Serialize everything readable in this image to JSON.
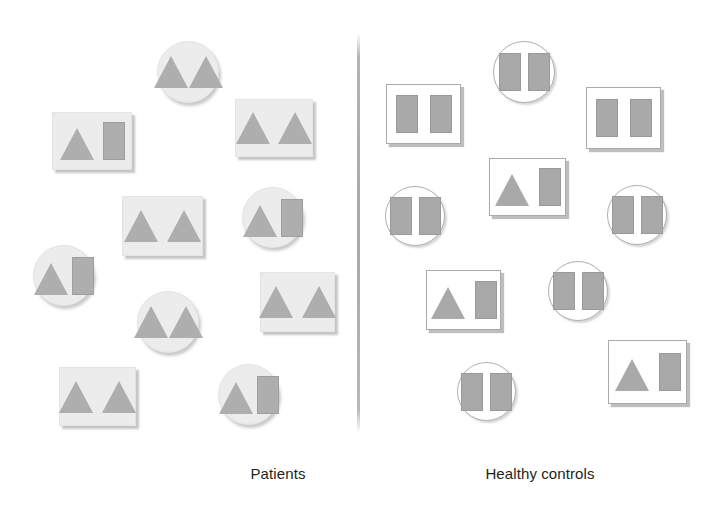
{
  "figure": {
    "width": 717,
    "height": 515,
    "background": "#ffffff",
    "divider": {
      "x": 357,
      "y": 33,
      "length": 400,
      "color": "#a8a8a8"
    },
    "glyph_color": "#a9a9a9",
    "caption_color": "#231f20",
    "filled_card_fill": "#ececed",
    "outline_card_stroke": "#a9a9a9"
  },
  "groups": [
    {
      "id": "patients",
      "caption": "Patients",
      "caption_x": 278,
      "caption_y": 465,
      "card_style": "filled",
      "items": [
        {
          "shape": "circle",
          "x": 157,
          "y": 41,
          "w": 62,
          "h": 62,
          "glyphs": [
            "triangle",
            "triangle"
          ],
          "gap": 1
        },
        {
          "shape": "square",
          "x": 52,
          "y": 112,
          "w": 80,
          "h": 58,
          "glyphs": [
            "triangle",
            "rect"
          ],
          "gap": 9
        },
        {
          "shape": "square",
          "x": 235,
          "y": 99,
          "w": 78,
          "h": 58,
          "glyphs": [
            "triangle",
            "triangle"
          ],
          "gap": 8
        },
        {
          "shape": "square",
          "x": 122,
          "y": 196,
          "w": 81,
          "h": 60,
          "glyphs": [
            "triangle",
            "triangle"
          ],
          "gap": 9
        },
        {
          "shape": "circle",
          "x": 242,
          "y": 187,
          "w": 61,
          "h": 61,
          "glyphs": [
            "triangle",
            "rect"
          ],
          "gap": 4
        },
        {
          "shape": "circle",
          "x": 33,
          "y": 245,
          "w": 61,
          "h": 61,
          "glyphs": [
            "triangle",
            "rect"
          ],
          "gap": 4
        },
        {
          "shape": "square",
          "x": 260,
          "y": 272,
          "w": 75,
          "h": 60,
          "glyphs": [
            "triangle",
            "triangle"
          ],
          "gap": 9
        },
        {
          "shape": "circle",
          "x": 137,
          "y": 291,
          "w": 62,
          "h": 62,
          "glyphs": [
            "triangle",
            "triangle"
          ],
          "gap": 1
        },
        {
          "shape": "square",
          "x": 59,
          "y": 367,
          "w": 77,
          "h": 59,
          "glyphs": [
            "triangle",
            "triangle"
          ],
          "gap": 9
        },
        {
          "shape": "circle",
          "x": 218,
          "y": 364,
          "w": 61,
          "h": 61,
          "glyphs": [
            "triangle",
            "rect"
          ],
          "gap": 4
        }
      ]
    },
    {
      "id": "healthy-controls",
      "caption": "Healthy controls",
      "caption_x": 540,
      "caption_y": 465,
      "card_style": "outline",
      "items": [
        {
          "shape": "circle",
          "x": 493,
          "y": 41,
          "w": 62,
          "h": 62,
          "glyphs": [
            "rect",
            "rect"
          ],
          "gap": 7
        },
        {
          "shape": "square",
          "x": 386,
          "y": 84,
          "w": 75,
          "h": 60,
          "glyphs": [
            "rect",
            "rect"
          ],
          "gap": 12
        },
        {
          "shape": "square",
          "x": 586,
          "y": 87,
          "w": 75,
          "h": 62,
          "glyphs": [
            "rect",
            "rect"
          ],
          "gap": 12
        },
        {
          "shape": "square",
          "x": 489,
          "y": 158,
          "w": 77,
          "h": 58,
          "glyphs": [
            "triangle",
            "rect"
          ],
          "gap": 10
        },
        {
          "shape": "circle",
          "x": 385,
          "y": 186,
          "w": 60,
          "h": 60,
          "glyphs": [
            "rect",
            "rect"
          ],
          "gap": 7
        },
        {
          "shape": "circle",
          "x": 607,
          "y": 185,
          "w": 60,
          "h": 60,
          "glyphs": [
            "rect",
            "rect"
          ],
          "gap": 7
        },
        {
          "shape": "circle",
          "x": 548,
          "y": 261,
          "w": 60,
          "h": 60,
          "glyphs": [
            "rect",
            "rect"
          ],
          "gap": 7
        },
        {
          "shape": "square",
          "x": 426,
          "y": 270,
          "w": 75,
          "h": 60,
          "glyphs": [
            "triangle",
            "rect"
          ],
          "gap": 10
        },
        {
          "shape": "circle",
          "x": 457,
          "y": 362,
          "w": 59,
          "h": 59,
          "glyphs": [
            "rect",
            "rect"
          ],
          "gap": 7
        },
        {
          "shape": "square",
          "x": 608,
          "y": 340,
          "w": 79,
          "h": 64,
          "glyphs": [
            "triangle",
            "rect"
          ],
          "gap": 10
        }
      ]
    }
  ]
}
